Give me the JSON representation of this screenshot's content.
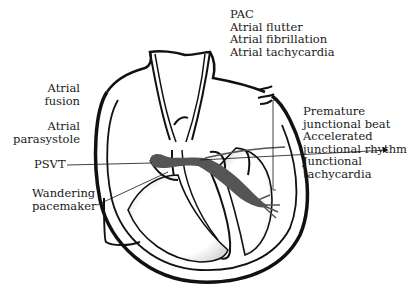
{
  "diagram": {
    "labels": {
      "atrial_group": [
        "PAC",
        "Atrial flutter",
        "Atrial fibrillation",
        "Atrial tachycardia"
      ],
      "atrial_fusion": [
        "Atrial",
        "fusion"
      ],
      "atrial_parasystole": [
        "Atrial",
        "parasystole"
      ],
      "psvt": "PSVT",
      "wandering_pacemaker": [
        "Wandering",
        "pacemaker"
      ],
      "junctional_group": [
        "Premature",
        "junctional beat",
        "Accelerated",
        "junctional rhythm",
        "Junctional",
        "tachycardia"
      ]
    },
    "colors": {
      "outline": "#111111",
      "conduction_path": "#555555",
      "shading": "#cfcfcf",
      "background": "#ffffff"
    }
  }
}
